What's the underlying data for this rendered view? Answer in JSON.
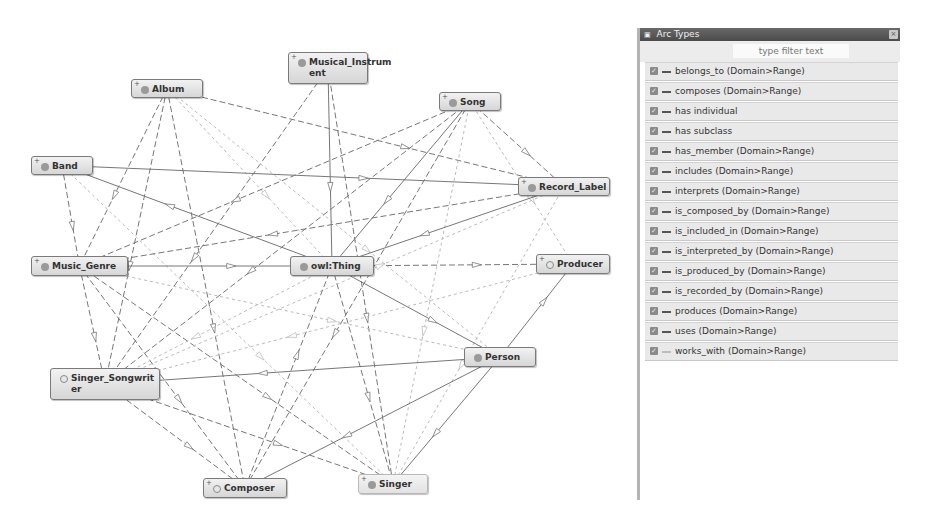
{
  "graph": {
    "nodes": [
      {
        "id": "album",
        "label": "Album",
        "x": 131,
        "y": 79,
        "w": 72,
        "h": 19,
        "plus": true,
        "dot": "filled"
      },
      {
        "id": "musical_instrument",
        "label": "Musical_Instrum\nent",
        "x": 288,
        "y": 52,
        "w": 80,
        "h": 32,
        "plus": true,
        "dot": "filled"
      },
      {
        "id": "song",
        "label": "Song",
        "x": 439,
        "y": 92,
        "w": 62,
        "h": 19,
        "plus": true,
        "dot": "filled"
      },
      {
        "id": "band",
        "label": "Band",
        "x": 31,
        "y": 156,
        "w": 62,
        "h": 19,
        "plus": true,
        "dot": "filled"
      },
      {
        "id": "record_label",
        "label": "Record_Label",
        "x": 518,
        "y": 177,
        "w": 92,
        "h": 19,
        "plus": true,
        "dot": "filled"
      },
      {
        "id": "music_genre",
        "label": "Music_Genre",
        "x": 31,
        "y": 256,
        "w": 97,
        "h": 20,
        "plus": true,
        "dot": "filled"
      },
      {
        "id": "owl_thing",
        "label": "owl:Thing",
        "x": 290,
        "y": 256,
        "w": 84,
        "h": 20,
        "plus": false,
        "dot": "filled"
      },
      {
        "id": "producer",
        "label": "Producer",
        "x": 536,
        "y": 254,
        "w": 74,
        "h": 20,
        "plus": true,
        "dot": "hollow"
      },
      {
        "id": "person",
        "label": "Person",
        "x": 464,
        "y": 347,
        "w": 72,
        "h": 20,
        "plus": false,
        "dot": "filled"
      },
      {
        "id": "singer_songwriter",
        "label": "Singer_Songwrit\ner",
        "x": 50,
        "y": 368,
        "w": 110,
        "h": 32,
        "plus": false,
        "dot": "hollow"
      },
      {
        "id": "composer",
        "label": "Composer",
        "x": 203,
        "y": 478,
        "w": 84,
        "h": 20,
        "plus": true,
        "dot": "hollow"
      },
      {
        "id": "singer",
        "label": "Singer",
        "x": 358,
        "y": 474,
        "w": 70,
        "h": 20,
        "plus": true,
        "dot": "filled",
        "flat": true
      }
    ],
    "edges": [
      {
        "from": "album",
        "to": "record_label",
        "style": "dashed"
      },
      {
        "from": "album",
        "to": "music_genre",
        "style": "dashed"
      },
      {
        "from": "album",
        "to": "singer_songwriter",
        "style": "dashed"
      },
      {
        "from": "album",
        "to": "owl_thing",
        "style": "light"
      },
      {
        "from": "album",
        "to": "person",
        "style": "light"
      },
      {
        "from": "album",
        "to": "composer",
        "style": "dashed"
      },
      {
        "from": "musical_instrument",
        "to": "owl_thing",
        "style": "solid"
      },
      {
        "from": "musical_instrument",
        "to": "singer",
        "style": "dashed"
      },
      {
        "from": "musical_instrument",
        "to": "singer_songwriter",
        "style": "dashed"
      },
      {
        "from": "song",
        "to": "record_label",
        "style": "dashed"
      },
      {
        "from": "song",
        "to": "owl_thing",
        "style": "solid"
      },
      {
        "from": "song",
        "to": "music_genre",
        "style": "dashed"
      },
      {
        "from": "song",
        "to": "singer_songwriter",
        "style": "dashed"
      },
      {
        "from": "song",
        "to": "composer",
        "style": "dashed"
      },
      {
        "from": "song",
        "to": "singer",
        "style": "light"
      },
      {
        "from": "song",
        "to": "producer",
        "style": "light"
      },
      {
        "from": "band",
        "to": "music_genre",
        "style": "dashed"
      },
      {
        "from": "band",
        "to": "record_label",
        "style": "solid"
      },
      {
        "from": "band",
        "to": "singer",
        "style": "light"
      },
      {
        "from": "record_label",
        "to": "owl_thing",
        "style": "solid"
      },
      {
        "from": "record_label",
        "to": "music_genre",
        "style": "dashed"
      },
      {
        "from": "record_label",
        "to": "singer",
        "style": "light"
      },
      {
        "from": "music_genre",
        "to": "owl_thing",
        "style": "solid"
      },
      {
        "from": "music_genre",
        "to": "singer_songwriter",
        "style": "dashed"
      },
      {
        "from": "music_genre",
        "to": "composer",
        "style": "dashed"
      },
      {
        "from": "music_genre",
        "to": "singer",
        "style": "dashed"
      },
      {
        "from": "music_genre",
        "to": "person",
        "style": "light"
      },
      {
        "from": "owl_thing",
        "to": "producer",
        "style": "dashed"
      },
      {
        "from": "owl_thing",
        "to": "person",
        "style": "solid"
      },
      {
        "from": "owl_thing",
        "to": "singer",
        "style": "dashed"
      },
      {
        "from": "owl_thing",
        "to": "singer_songwriter",
        "style": "light"
      },
      {
        "from": "owl_thing",
        "to": "band",
        "style": "solid"
      },
      {
        "from": "person",
        "to": "singer_songwriter",
        "style": "solid"
      },
      {
        "from": "person",
        "to": "composer",
        "style": "solid"
      },
      {
        "from": "person",
        "to": "singer",
        "style": "solid"
      },
      {
        "from": "person",
        "to": "producer",
        "style": "solid"
      },
      {
        "from": "singer_songwriter",
        "to": "singer",
        "style": "dashed"
      },
      {
        "from": "singer_songwriter",
        "to": "composer",
        "style": "dashed"
      },
      {
        "from": "singer_songwriter",
        "to": "record_label",
        "style": "light"
      },
      {
        "from": "composer",
        "to": "owl_thing",
        "style": "dashed"
      },
      {
        "from": "producer",
        "to": "singer_songwriter",
        "style": "light"
      }
    ]
  },
  "arc_panel": {
    "title": "Arc Types",
    "title_icon": "window-icon",
    "close_icon": "close-icon",
    "filter": {
      "placeholder": "type filter text",
      "value": ""
    },
    "items": [
      {
        "label": "belongs_to (Domain>Range)",
        "checked": true,
        "line": "dark"
      },
      {
        "label": "composes (Domain>Range)",
        "checked": true,
        "line": "dark"
      },
      {
        "label": "has individual",
        "checked": true,
        "line": "dark"
      },
      {
        "label": "has subclass",
        "checked": true,
        "line": "dark"
      },
      {
        "label": "has_member (Domain>Range)",
        "checked": true,
        "line": "dark"
      },
      {
        "label": "includes (Domain>Range)",
        "checked": true,
        "line": "dark"
      },
      {
        "label": "interprets (Domain>Range)",
        "checked": true,
        "line": "dark"
      },
      {
        "label": "is_composed_by (Domain>Range)",
        "checked": true,
        "line": "dark"
      },
      {
        "label": "is_included_in (Domain>Range)",
        "checked": true,
        "line": "dark"
      },
      {
        "label": "is_interpreted_by (Domain>Range)",
        "checked": true,
        "line": "dark"
      },
      {
        "label": "is_produced_by (Domain>Range)",
        "checked": true,
        "line": "dark"
      },
      {
        "label": "is_recorded_by (Domain>Range)",
        "checked": true,
        "line": "dark"
      },
      {
        "label": "produces (Domain>Range)",
        "checked": true,
        "line": "dark"
      },
      {
        "label": "uses (Domain>Range)",
        "checked": true,
        "line": "dark"
      },
      {
        "label": "works_with (Domain>Range)",
        "checked": true,
        "line": "light"
      }
    ]
  },
  "colors": {
    "edge_dark": "#777777",
    "edge_light": "#bbbbbb",
    "titlebar": "#555555",
    "row_bg": "#e9e9e9"
  }
}
